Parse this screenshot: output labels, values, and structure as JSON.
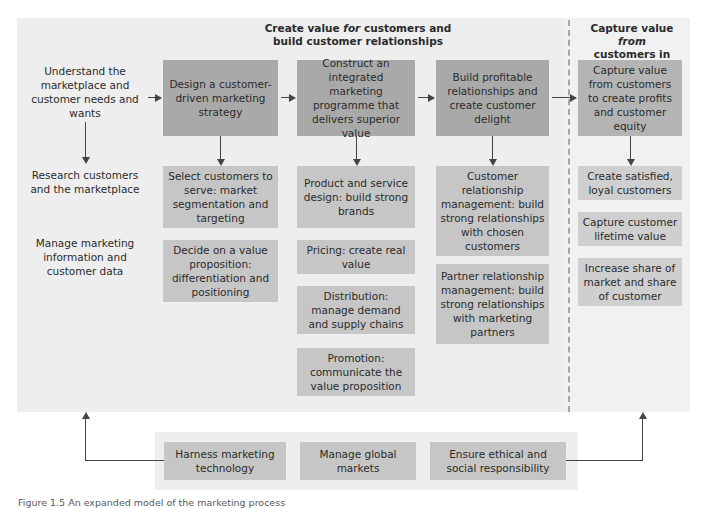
{
  "figure": {
    "caption": "Figure 1.5 An expanded model of the marketing process"
  },
  "headings": {
    "create_value_line1_a": "Create value ",
    "create_value_italic": "for",
    "create_value_line1_b": " customers and",
    "create_value_line2": "build customer relationships",
    "capture_value_line1_a": "Capture value ",
    "capture_value_italic": "from",
    "capture_value_line2": "customers in return"
  },
  "columns": {
    "understand": {
      "step1": "Understand the marketplace and customer needs and wants",
      "step2": "Research customers and the marketplace",
      "step3": "Manage marketing information and customer data"
    },
    "design": {
      "step1": "Design a customer-driven marketing strategy",
      "step2": "Select customers to serve: market segmentation and targeting",
      "step3": "Decide on a value proposition: differentiation and positioning"
    },
    "construct": {
      "step1": "Construct an integrated marketing programme that delivers superior value",
      "step2": "Product and service design: build strong brands",
      "step3": "Pricing: create real value",
      "step4": "Distribution: manage demand and supply chains",
      "step5": "Promotion: communicate the value proposition"
    },
    "build": {
      "step1": "Build profitable relationships and create customer delight",
      "step2": "Customer relationship management: build strong relationships with chosen customers",
      "step3": "Partner relationship management: build strong relationships with marketing partners"
    },
    "capture": {
      "step1": "Capture value from customers to create profits and customer equity",
      "step2": "Create satisfied, loyal customers",
      "step3": "Capture customer lifetime value",
      "step4": "Increase share of market and share of customer"
    }
  },
  "bottom_row": {
    "item1": "Harness marketing technology",
    "item2": "Manage global markets",
    "item3": "Ensure ethical and social responsibility"
  },
  "colors": {
    "panel_background": "#eeeeee",
    "capture_panel_background": "#f1f1f1",
    "box_dark": "#a9a9a9",
    "box_mid": "#b4b4b4",
    "box_light": "#c6c6c6",
    "box_pale": "#cfcfcf",
    "arrow": "#444444",
    "divider": "#a6a6a6",
    "text": "#2b2b2b"
  }
}
